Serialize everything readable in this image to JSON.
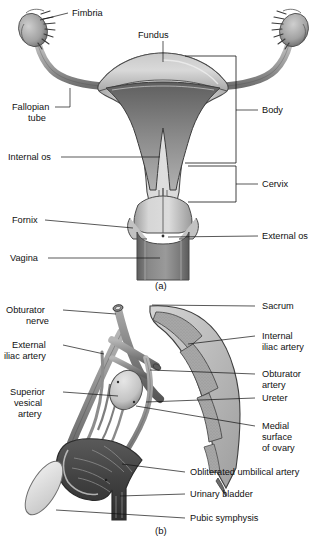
{
  "page": {
    "background_color": "#ffffff",
    "text_color": "#111111"
  },
  "figure_a": {
    "caption": "(a)",
    "subject": "Coronal section of uterus, fallopian tubes, cervix and vagina",
    "labels": {
      "fimbria": "Fimbria",
      "fundus": "Fundus",
      "fallopian_tube_line1": "Fallopian",
      "fallopian_tube_line2": "tube",
      "internal_os": "Internal os",
      "fornix": "Fornix",
      "vagina": "Vagina",
      "body": "Body",
      "cervix": "Cervix",
      "external_os": "External os"
    },
    "bracket_labels": [
      "Body",
      "Cervix"
    ]
  },
  "figure_b": {
    "caption": "(b)",
    "subject": "Left pelvic side wall showing vessels, ureter, ovary and bladder",
    "labels": {
      "obturator_nerve_line1": "Obturator",
      "obturator_nerve_line2": "nerve",
      "external_iliac_artery_line1": "External",
      "external_iliac_artery_line2": "iliac artery",
      "superior_vesical_artery_line1": "Superior",
      "superior_vesical_artery_line2": "vesical",
      "superior_vesical_artery_line3": "artery",
      "sacrum": "Sacrum",
      "internal_iliac_artery_line1": "Internal",
      "internal_iliac_artery_line2": "iliac artery",
      "obturator_artery_line1": "Obturator",
      "obturator_artery_line2": "artery",
      "ureter": "Ureter",
      "medial_surface_of_ovary_line1": "Medial",
      "medial_surface_of_ovary_line2": "surface",
      "medial_surface_of_ovary_line3": "of ovary",
      "obliterated_umbilical_artery": "Obliterated umbilical artery",
      "urinary_bladder": "Urinary bladder",
      "pubic_symphysis": "Pubic symphysis"
    }
  },
  "palette": {
    "outline": "#111111",
    "tissue_light": "#d8d8d8",
    "tissue_mid": "#b4b4b4",
    "tissue_dark": "#8a8a8a",
    "cavity_dark": "#6e6e6e",
    "vagina_dark": "#7a7a7a",
    "vessel": "#8d8d8d",
    "vessel_dark": "#6a6a6a",
    "bone_fill": "#a9a9a9",
    "bladder_dark": "#4a4a4a",
    "ovary": "#cfcfcf",
    "symphysis": "#e2e2e2"
  }
}
